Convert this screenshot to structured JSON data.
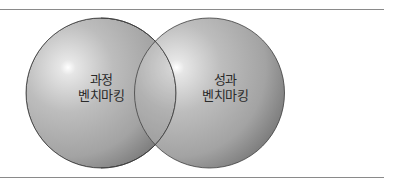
{
  "diagram": {
    "type": "venn",
    "circles": [
      {
        "id": "process",
        "label_line1": "과정",
        "label_line2": "벤치마킹",
        "cx": 101,
        "cy": 93,
        "r": 75
      },
      {
        "id": "performance",
        "label_line1": "성과",
        "label_line2": "벤치마킹",
        "cx": 209.5,
        "cy": 93,
        "r": 75
      }
    ],
    "colors": {
      "sphere_light": "#d9d9d9",
      "sphere_mid": "#a6a6a6",
      "sphere_dark": "#6f6f6f",
      "outline": "#3c3c3c",
      "rule": "#8a8a8a",
      "text": "#2a2a2a"
    }
  }
}
